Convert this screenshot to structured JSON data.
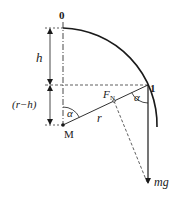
{
  "diagram": {
    "labels": {
      "point_top": "0",
      "point_1": "1",
      "height": "h",
      "remaining": "(r−h)",
      "center": "M",
      "radius": "r",
      "angle_center": "α",
      "angle_point1": "α",
      "normal_force_main": "F",
      "normal_force_sub": "N",
      "weight": "mg"
    },
    "colors": {
      "stroke": "#1a1a1a",
      "background": "#ffffff"
    }
  }
}
